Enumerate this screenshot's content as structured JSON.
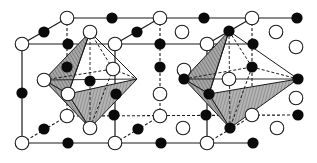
{
  "diagram": {
    "title": "",
    "colors": {
      "background": "#ffffff",
      "line": "#1a1a1a",
      "filled_atom": "#0a0a0a",
      "open_atom_fill": "#ffffff",
      "hatch_face": "#9a9a9a",
      "hatch_line": "#555555"
    },
    "legend": [],
    "atom_types": [
      {
        "name": "open-atom",
        "style": "open circle"
      },
      {
        "name": "filled-atom",
        "style": "filled black circle"
      }
    ],
    "open_atoms": [
      [
        67,
        18
      ],
      [
        160,
        18
      ],
      [
        252,
        18
      ],
      [
        90,
        32
      ],
      [
        182,
        32
      ],
      [
        276,
        32
      ],
      [
        22,
        44
      ],
      [
        115,
        44
      ],
      [
        207,
        44
      ],
      [
        296,
        47
      ],
      [
        113,
        69
      ],
      [
        184,
        70
      ],
      [
        44,
        80
      ],
      [
        229,
        79
      ],
      [
        68,
        94
      ],
      [
        160,
        94
      ],
      [
        296,
        98
      ],
      [
        67,
        116
      ],
      [
        160,
        116
      ],
      [
        252,
        115
      ],
      [
        90,
        128
      ],
      [
        183,
        128
      ],
      [
        277,
        128
      ],
      [
        22,
        143
      ],
      [
        115,
        143
      ],
      [
        207,
        143
      ]
    ],
    "filled_atoms": [
      [
        112,
        18
      ],
      [
        204,
        18
      ],
      [
        297,
        18
      ],
      [
        44,
        32
      ],
      [
        137,
        32
      ],
      [
        229,
        31
      ],
      [
        68,
        44
      ],
      [
        160,
        44
      ],
      [
        253,
        44
      ],
      [
        67,
        67
      ],
      [
        160,
        67
      ],
      [
        252,
        67
      ],
      [
        90,
        81
      ],
      [
        184,
        79
      ],
      [
        298,
        79
      ],
      [
        22,
        93
      ],
      [
        116,
        94
      ],
      [
        209,
        94
      ],
      [
        114,
        115
      ],
      [
        206,
        115
      ],
      [
        298,
        115
      ],
      [
        44,
        129
      ],
      [
        138,
        129
      ],
      [
        230,
        128
      ],
      [
        68,
        143
      ],
      [
        161,
        143
      ],
      [
        253,
        143
      ]
    ],
    "octahedra": [
      {
        "name": "left-octahedron",
        "top": [
          90,
          32
        ],
        "bottom": [
          90,
          128
        ],
        "equator": [
          [
            44,
            80
          ],
          [
            68,
            94
          ],
          [
            137,
            79
          ],
          [
            113,
            69
          ]
        ],
        "center": [
          90,
          81
        ]
      },
      {
        "name": "right-octahedron",
        "top": [
          229,
          31
        ],
        "bottom": [
          230,
          128
        ],
        "equator": [
          [
            184,
            79
          ],
          [
            209,
            94
          ],
          [
            275,
            82
          ],
          [
            252,
            67
          ]
        ],
        "center": [
          229,
          79
        ]
      }
    ]
  }
}
